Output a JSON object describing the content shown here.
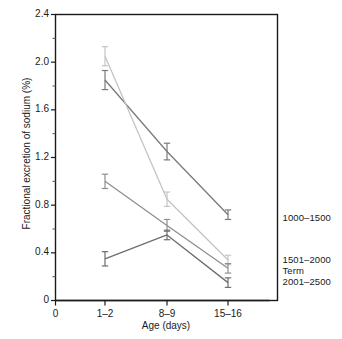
{
  "chart_data": {
    "type": "line",
    "title": "",
    "xlabel": "Age (days)",
    "ylabel": "Fractional excretion of sodium (%)",
    "categories": [
      "1–2",
      "8–9",
      "15–16"
    ],
    "x_tick_labels": [
      "0",
      "1–2",
      "8–9",
      "15–16"
    ],
    "y_tick_labels": [
      "0",
      "0.4",
      "0.8",
      "1.2",
      "1.6",
      "2.0",
      "2.4"
    ],
    "y_tick_values": [
      0,
      0.4,
      0.8,
      1.2,
      1.6,
      2.0,
      2.4
    ],
    "y_minor_tick_values": [
      0.2,
      0.6,
      1.0,
      1.4,
      1.8,
      2.2
    ],
    "ylim": [
      0,
      2.4
    ],
    "grid": false,
    "legend_position": "right-inline",
    "error_bars": true,
    "series": [
      {
        "name": "1000–1500",
        "color": "#7a7a7a",
        "values": [
          1.85,
          1.25,
          0.72
        ],
        "errors": [
          0.08,
          0.07,
          0.04
        ]
      },
      {
        "name": "1501–2000",
        "color": "#c4c4c4",
        "values": [
          2.05,
          0.85,
          0.34
        ],
        "errors": [
          0.08,
          0.06,
          0.04
        ]
      },
      {
        "name": "Term",
        "color": "#8f8f8f",
        "values": [
          1.0,
          0.63,
          0.27
        ],
        "errors": [
          0.06,
          0.05,
          0.04
        ]
      },
      {
        "name": "2001–2500",
        "color": "#6e6e6e",
        "values": [
          0.35,
          0.55,
          0.15
        ],
        "errors": [
          0.06,
          0.04,
          0.04
        ]
      }
    ]
  },
  "labels": {
    "series_0": "1000–1500",
    "series_1": "1501–2000",
    "series_2": "Term",
    "series_3": "2001–2500"
  },
  "axis": {
    "x_title": "Age (days)",
    "y_title": "Fractional excretion of sodium (%)",
    "x_ticks": [
      "0",
      "1–2",
      "8–9",
      "15–16"
    ],
    "y_ticks": [
      "0",
      "0.4",
      "0.8",
      "1.2",
      "1.6",
      "2.0",
      "2.4"
    ]
  },
  "colors": {
    "frame": "#1a1a1a",
    "text": "#1a1a1a",
    "background": "#ffffff"
  }
}
